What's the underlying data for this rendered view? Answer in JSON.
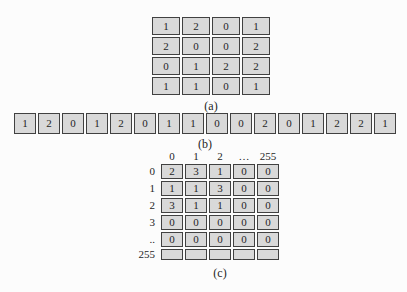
{
  "part_a": {
    "label": "(a)",
    "rows": [
      [
        "1",
        "2",
        "0",
        "1"
      ],
      [
        "2",
        "0",
        "0",
        "2"
      ],
      [
        "0",
        "1",
        "2",
        "2"
      ],
      [
        "1",
        "1",
        "0",
        "1"
      ]
    ]
  },
  "part_b": {
    "label": "(b)",
    "cells": [
      "1",
      "2",
      "0",
      "1",
      "2",
      "0",
      "1",
      "1",
      "0",
      "0",
      "2",
      "0",
      "1",
      "2",
      "2",
      "1"
    ]
  },
  "part_c": {
    "label": "(c)",
    "col_headers": [
      "0",
      "1",
      "2",
      "…",
      "255"
    ],
    "row_headers": [
      "0",
      "1",
      "2",
      "3",
      "..",
      "255"
    ],
    "rows": [
      [
        "2",
        "3",
        "1",
        "0",
        "0"
      ],
      [
        "1",
        "1",
        "3",
        "0",
        "0"
      ],
      [
        "3",
        "1",
        "1",
        "0",
        "0"
      ],
      [
        "0",
        "0",
        "0",
        "0",
        "0"
      ],
      [
        "0",
        "0",
        "0",
        "0",
        "0"
      ]
    ]
  },
  "colors": {
    "page_bg": "#fcfcfc",
    "cell_bg": "#d9d9d9",
    "border": "#414141",
    "text": "#1f1f1f"
  }
}
